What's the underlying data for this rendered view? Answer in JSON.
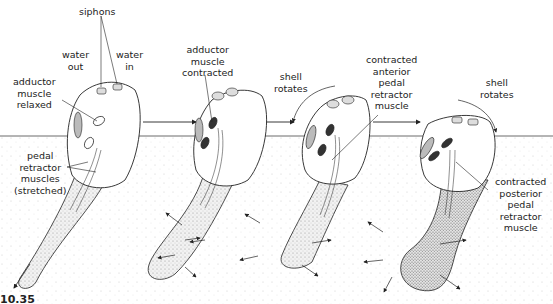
{
  "diagram": {
    "figure_label": "10.35",
    "colors": {
      "ink": "#222222",
      "sediment_dot": "#bbbbbb",
      "shell_fill": "#ffffff",
      "foot_fill": "#e8e8e8"
    },
    "stages": [
      {
        "id": 1,
        "labels": {
          "siphons": "siphons",
          "water_out": [
            "water",
            "out"
          ],
          "water_in": [
            "water",
            "in"
          ],
          "adductor": [
            "adductor",
            "muscle",
            "relaxed"
          ],
          "pedal": [
            "pedal",
            "retractor",
            "muscles",
            "(stretched)"
          ]
        }
      },
      {
        "id": 2,
        "labels": {
          "adductor": [
            "adductor",
            "muscle",
            "contracted"
          ]
        }
      },
      {
        "id": 3,
        "labels": {
          "rotation": [
            "shell",
            "rotates"
          ],
          "anterior": [
            "contracted",
            "anterior",
            "pedal",
            "retractor",
            "muscle"
          ]
        }
      },
      {
        "id": 4,
        "labels": {
          "rotation": [
            "shell",
            "rotates"
          ],
          "posterior": [
            "contracted",
            "posterior",
            "pedal",
            "retractor",
            "muscle"
          ]
        }
      }
    ]
  }
}
